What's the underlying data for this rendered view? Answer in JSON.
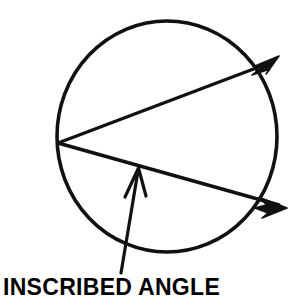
{
  "figure": {
    "background_color": "#ffffff",
    "stroke_color": "#111111",
    "caption": "INSCRIBED ANGLE",
    "circle": {
      "name": "circle",
      "center_x": 167,
      "center_y": 136,
      "radius": 110,
      "stroke_width": 3.6,
      "fill": "none"
    },
    "rays": [
      {
        "name": "upper-ray",
        "label": "upper ray of inscribed angle",
        "x1": 58,
        "y1": 143,
        "x2": 276,
        "y2": 60,
        "stroke_width": 3.4
      },
      {
        "name": "lower-ray",
        "label": "lower ray of inscribed angle",
        "x1": 58,
        "y1": 143,
        "x2": 283,
        "y2": 207,
        "stroke_width": 3.4
      }
    ],
    "vertex": {
      "name": "angle-vertex",
      "x": 58,
      "y": 143,
      "label": "vertex on circle"
    },
    "pointer": {
      "name": "pointer-arrow",
      "label": "callout arrow to inscribed angle",
      "tail_x": 122,
      "tail_y": 272,
      "tip_x": 139,
      "tip_y": 169,
      "stroke_width": 3.2
    },
    "arrowheads": [
      {
        "name": "upper-ray-arrowhead",
        "tip_x": 276,
        "tip_y": 60,
        "angle_deg": -21
      },
      {
        "name": "lower-ray-arrowhead",
        "tip_x": 283,
        "tip_y": 207,
        "angle_deg": 16
      }
    ]
  }
}
